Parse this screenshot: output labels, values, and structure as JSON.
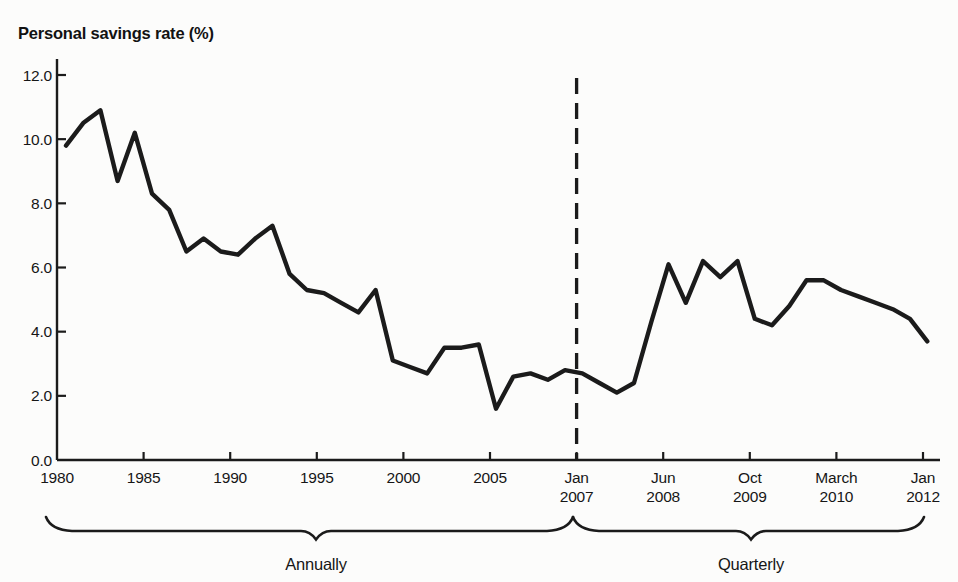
{
  "title": "Personal savings rate (%)",
  "colors": {
    "ink": "#1b1b1b",
    "text": "#161616",
    "background": "#fcfcfb"
  },
  "chart_data": {
    "type": "line",
    "title": "Personal savings rate (%)",
    "ylabel": "Personal savings rate (%)",
    "ylim": [
      0,
      12
    ],
    "ytick_step": 2,
    "ytick_labels": [
      "0.0",
      "2.0",
      "4.0",
      "6.0",
      "8.0",
      "10.0",
      "12.0"
    ],
    "xtick_labels": [
      [
        "1980"
      ],
      [
        "1985"
      ],
      [
        "1990"
      ],
      [
        "1995"
      ],
      [
        "2000"
      ],
      [
        "2005"
      ],
      [
        "Jan",
        "2007"
      ],
      [
        "Jun",
        "2008"
      ],
      [
        "Oct",
        "2009"
      ],
      [
        "March",
        "2010"
      ],
      [
        "Jan",
        "2012"
      ]
    ],
    "grid": "off",
    "legend": "none",
    "divider": {
      "at_label": "Jan 2007",
      "style": "dashed-vertical-line"
    },
    "series": [
      {
        "name": "Annual personal savings rate",
        "frequency": "annual",
        "start_year": 1980,
        "end_year": 2005,
        "values": [
          9.8,
          10.5,
          10.9,
          8.7,
          10.2,
          8.3,
          7.8,
          6.5,
          6.9,
          6.5,
          6.4,
          6.9,
          7.3,
          5.8,
          5.3,
          5.2,
          4.9,
          4.6,
          5.3,
          3.1,
          2.9,
          2.7,
          3.5,
          3.5,
          3.6,
          1.6
        ]
      },
      {
        "name": "Quarterly personal savings rate",
        "frequency": "quarterly",
        "start": "2006 Q1",
        "end": "2012 Q1",
        "values": [
          2.6,
          2.7,
          2.5,
          2.8,
          2.7,
          2.4,
          2.1,
          2.4,
          4.3,
          6.1,
          4.9,
          6.2,
          5.7,
          6.2,
          4.4,
          4.2,
          4.8,
          5.6,
          5.6,
          5.3,
          5.1,
          4.9,
          4.7,
          4.4,
          3.7
        ]
      }
    ],
    "group_braces": [
      {
        "label": "Annually"
      },
      {
        "label": "Quarterly"
      }
    ]
  }
}
